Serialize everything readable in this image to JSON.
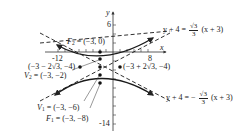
{
  "diagram": {
    "type": "hyperbola-graph",
    "axes": {
      "x_label": "x",
      "y_label": "y",
      "x_ticks_labeled": [
        "-12",
        "8"
      ],
      "y_ticks_labeled": [
        "6",
        "-14"
      ]
    },
    "points": {
      "F2": {
        "label": "F",
        "sub": "2",
        "coords": "= (−3, 0)"
      },
      "V2": {
        "label": "V",
        "sub": "2",
        "coords": "= (−3, −2)"
      },
      "V1": {
        "label": "V",
        "sub": "1",
        "coords": "= (−3, −6)"
      },
      "F1": {
        "label": "F",
        "sub": "1",
        "coords": "= (−3, −8)"
      },
      "left_point": {
        "text": "(−3 − 2√3, −4)"
      },
      "right_point": {
        "text": "(−3 + 2√3, −4)"
      }
    },
    "asymptotes": {
      "upper": {
        "lhs": "y + 4 =",
        "sign": "",
        "num": "√3",
        "den": "3",
        "rhs": "(x + 3)"
      },
      "lower": {
        "lhs": "y + 4 = −",
        "sign": "−",
        "num": "√3",
        "den": "3",
        "rhs": "(x + 3)"
      }
    },
    "colors": {
      "curve": "#1a1a1a",
      "asymptote": "#1a1a1a",
      "axis": "#333333"
    }
  }
}
